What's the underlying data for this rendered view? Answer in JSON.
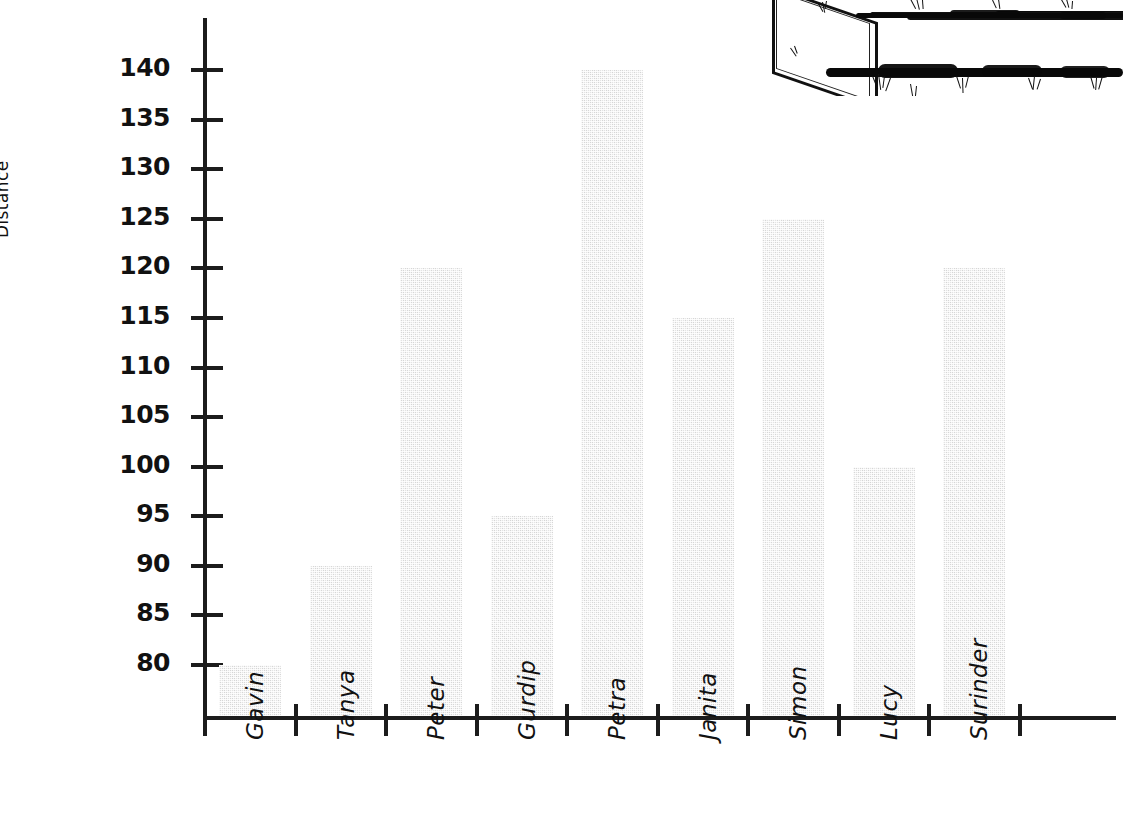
{
  "chart_data": {
    "type": "bar",
    "title": "",
    "xlabel": "",
    "ylabel": "Distance",
    "categories": [
      "Gavin",
      "Tanya",
      "Peter",
      "Gurdip",
      "Petra",
      "Janita",
      "Simon",
      "Lucy",
      "Surinder"
    ],
    "values": [
      80,
      90,
      120,
      95,
      140,
      115,
      125,
      100,
      120
    ],
    "yticks": [
      80,
      85,
      90,
      95,
      100,
      105,
      110,
      115,
      120,
      125,
      130,
      135,
      140
    ],
    "ylim": [
      76,
      145
    ],
    "grid": false,
    "legend": null,
    "bar_fill_color": "#e4e4e4",
    "axis_color": "#1c1c1c",
    "note": "y-axis truncated, starts at 80"
  },
  "artifact": {
    "name": "scanned-page-edge-artifact",
    "description": "photocopy smudge bands with skewed box outline"
  }
}
